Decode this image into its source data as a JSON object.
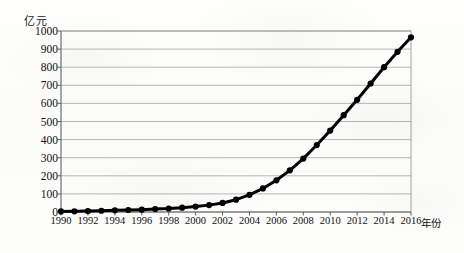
{
  "chart_data": {
    "type": "line",
    "title": "",
    "xlabel": "年份",
    "ylabel": "亿元",
    "x": [
      1990,
      1991,
      1992,
      1993,
      1994,
      1995,
      1996,
      1997,
      1998,
      1999,
      2000,
      2001,
      2002,
      2003,
      2004,
      2005,
      2006,
      2007,
      2008,
      2009,
      2010,
      2011,
      2012,
      2013,
      2014,
      2015,
      2016
    ],
    "values": [
      3,
      4,
      5,
      7,
      9,
      11,
      13,
      16,
      19,
      24,
      30,
      38,
      50,
      68,
      95,
      130,
      175,
      230,
      295,
      370,
      450,
      535,
      620,
      710,
      800,
      885,
      965
    ],
    "series": [
      {
        "name": "",
        "values": [
          3,
          4,
          5,
          7,
          9,
          11,
          13,
          16,
          19,
          24,
          30,
          38,
          50,
          68,
          95,
          130,
          175,
          230,
          295,
          370,
          450,
          535,
          620,
          710,
          800,
          885,
          965
        ]
      }
    ],
    "xtick_labels": [
      "1990",
      "1992",
      "1994",
      "1996",
      "1998",
      "2000",
      "2002",
      "2004",
      "2006",
      "2008",
      "2010",
      "2012",
      "2014",
      "2016"
    ],
    "xtick_values": [
      1990,
      1992,
      1994,
      1996,
      1998,
      2000,
      2002,
      2004,
      2006,
      2008,
      2010,
      2012,
      2014,
      2016
    ],
    "ytick_labels": [
      "0",
      "100",
      "200",
      "300",
      "400",
      "500",
      "600",
      "700",
      "800",
      "900",
      "1000"
    ],
    "ytick_values": [
      0,
      100,
      200,
      300,
      400,
      500,
      600,
      700,
      800,
      900,
      1000
    ],
    "xlim": [
      1990,
      2016
    ],
    "ylim": [
      0,
      1000
    ],
    "grid": "horizontal",
    "legend": "none",
    "marker": "circle",
    "line_color": "#000000",
    "grid_color": "#9a9a9a",
    "axis_color": "#8d8d8d",
    "background_color": "#fdfdfc"
  }
}
